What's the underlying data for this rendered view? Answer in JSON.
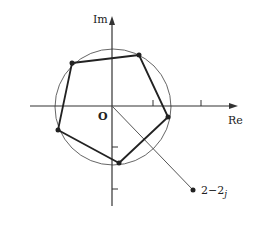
{
  "diagram": {
    "type": "complex-plane",
    "axes": {
      "real_label": "Re",
      "imag_label": "Im",
      "origin_label": "O",
      "real_ticks": [
        1,
        2
      ],
      "imag_ticks": [
        -1,
        -2
      ]
    },
    "circle": {
      "center": "origin",
      "description": "circle through pentagon vertices"
    },
    "pentagon": {
      "description": "regular pentagon inscribed in circle (fifth roots)",
      "vertex_count": 5
    },
    "point": {
      "label_main": "2−2",
      "label_sub": "j",
      "value": "2-2j"
    },
    "colors": {
      "ink": "#222222",
      "circle": "#666666",
      "axis": "#333333"
    }
  }
}
